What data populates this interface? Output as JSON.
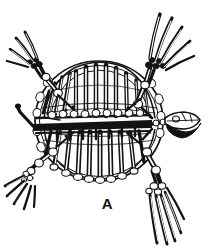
{
  "figure": {
    "label": "A",
    "caption_letter": "A",
    "background_color": "#ffffff",
    "ink_color": "#131313",
    "shade_color": "#5a5a5a",
    "width": 215,
    "height": 251
  },
  "anatomy": {
    "parts": [
      {
        "name": "carapace-outline",
        "label": "carapace"
      },
      {
        "name": "vertebral-column",
        "label": "vertebral column"
      },
      {
        "name": "skull",
        "label": "skull"
      },
      {
        "name": "cervical-vertebrae",
        "label": "cervical vertebrae"
      },
      {
        "name": "upper-ribs",
        "label": "dorsal ribs"
      },
      {
        "name": "lower-ribs",
        "label": "ventral ribs"
      },
      {
        "name": "peripheral-plates",
        "label": "peripheral plates"
      },
      {
        "name": "front-left-flipper",
        "label": "left forelimb"
      },
      {
        "name": "front-right-flipper",
        "label": "right forelimb"
      },
      {
        "name": "rear-left-flipper",
        "label": "left hindlimb"
      },
      {
        "name": "rear-right-flipper",
        "label": "right hindlimb"
      },
      {
        "name": "tail",
        "label": "caudal extension"
      }
    ]
  }
}
